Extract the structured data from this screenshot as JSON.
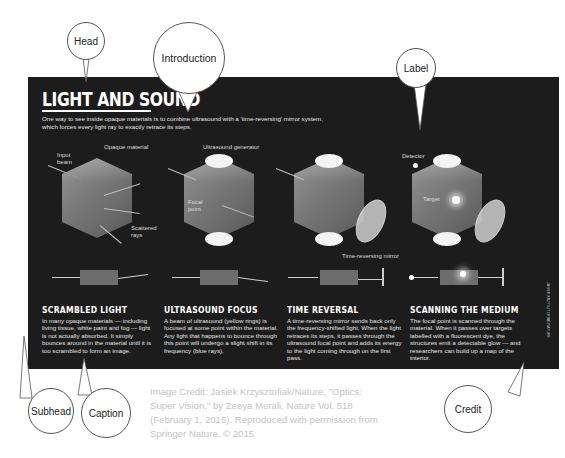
{
  "infographic": {
    "headline": "LIGHT AND SOUND",
    "intro": "One way to see inside opaque materials is to combine ultrasound with a 'time-reversing' mirror system, which forces every light ray to exactly retrace its steps.",
    "diagram_labels": {
      "input_beam": "Input beam",
      "opaque_material": "Opaque material",
      "scattered_rays": "Scattered rays",
      "ultrasound_generator": "Ultrasound generator",
      "focal_point": "Focal point",
      "time_reversing_mirror": "Time-reversing mirror",
      "detector": "Detector",
      "target": "Target"
    },
    "panels": [
      {
        "subhead": "SCRAMBLED LIGHT",
        "caption": "In many opaque materials — including living tissue, white paint and fog — light is not actually absorbed. It simply bounces around in the material until it is too scrambled to form an image."
      },
      {
        "subhead": "ULTRASOUND FOCUS",
        "caption": "A beam of ultrasound (yellow rings) is focused at some point within the material. Any light that happens to bounce through this point will undergo a slight shift in its frequency (blue rays)."
      },
      {
        "subhead": "TIME REVERSAL",
        "caption": "A time-reversing mirror sends back only the frequency-shifted light. When the light retraces its steps, it passes through the ultrasound focal point and adds its energy to the light coming through on the first pass."
      },
      {
        "subhead": "SCANNING THE MEDIUM",
        "caption": "The focal point is scanned through the material. When it passes over targets labelled with a fluorescent dye, the structures emit a detectable glow — and researchers can build up a map of the interior."
      }
    ],
    "vertical_credit": "JASIEK KRZYSZTOFIAK/NATURE"
  },
  "annotations": {
    "head": "Head",
    "introduction": "Introduction",
    "label": "Label",
    "subhead": "Subhead",
    "caption": "Caption",
    "credit": "Credit"
  },
  "source_credit": "Image Credit: Jasiek Krzysztofiak/Nature, \"Optics: Super Vision,\" by Zeeya Merali, Nature Vol. 518 (February 1, 2015). Reproduced with permission from Springer Nature. © 2015",
  "colors": {
    "panel_bg": "#1c1c1c",
    "panel_text": "#ffffff",
    "source_text": "#c4c4c4",
    "bubble_border": "#555555"
  }
}
